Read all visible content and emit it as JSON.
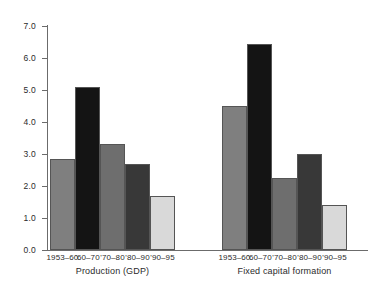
{
  "chart_data": {
    "type": "bar",
    "title": "",
    "subtitle": "",
    "xlabel": "",
    "ylabel": "",
    "ylim": [
      0.0,
      7.0
    ],
    "ytick_step": 1.0,
    "ytick_labels": [
      "0.0",
      "1.0",
      "2.0",
      "3.0",
      "4.0",
      "5.0",
      "6.0",
      "7.0"
    ],
    "ytick_values": [
      0.0,
      1.0,
      2.0,
      3.0,
      4.0,
      5.0,
      6.0,
      7.0
    ],
    "grid": false,
    "legend": "none",
    "categories": [
      "1953–60",
      "'60–70",
      "'70–80",
      "'80–90",
      "'90–95"
    ],
    "groups": [
      {
        "name": "Production (GDP)",
        "values": [
          2.85,
          5.1,
          3.3,
          2.7,
          1.7
        ]
      },
      {
        "name": "Fixed capital formation",
        "values": [
          4.5,
          6.45,
          2.25,
          3.0,
          1.4
        ]
      }
    ],
    "bar_colors": [
      "#7f7f7f",
      "#141414",
      "#6e6e6e",
      "#383838",
      "#d9d9d9"
    ],
    "bar_edge_color": "#555555",
    "axis_color": "#6b6b6b",
    "background_color": "#ffffff"
  }
}
